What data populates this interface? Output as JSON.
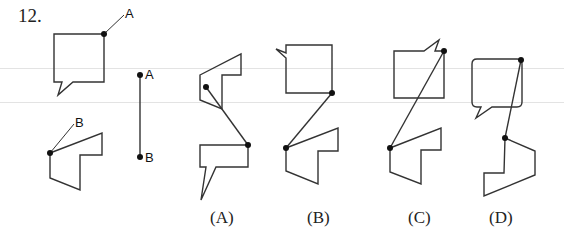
{
  "question": {
    "number": "12."
  },
  "reference": {
    "bubble_point_label": "A",
    "arrow_shape_point_label": "B",
    "segment_top_label": "A",
    "segment_bottom_label": "B"
  },
  "options": [
    {
      "label": "(A)"
    },
    {
      "label": "(B)"
    },
    {
      "label": "(C)"
    },
    {
      "label": "(D)"
    }
  ],
  "colors": {
    "stroke": "#333333",
    "dot": "#111111",
    "background": "#ffffff"
  }
}
